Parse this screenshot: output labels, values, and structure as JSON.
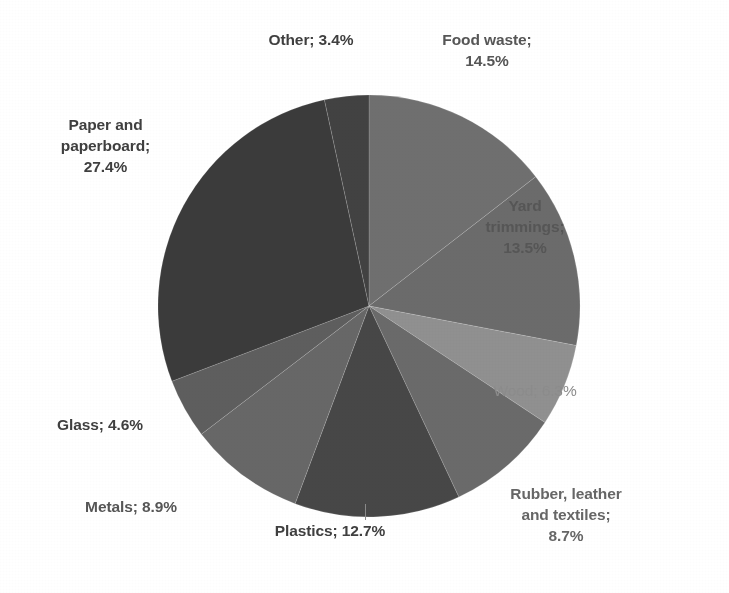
{
  "chart_data": {
    "type": "pie",
    "title": "",
    "subtitle": "",
    "xlabel": "",
    "ylabel": "",
    "legend_position": "none",
    "grid": false,
    "labels_show_name_and_percent": true,
    "label_separator": "; ",
    "start_angle_deg": 0,
    "direction": "clockwise",
    "categories": [
      "Food waste",
      "Yard trimmings",
      "Wood",
      "Rubber, leather and textiles",
      "Plastics",
      "Metals",
      "Glass",
      "Paper and paperboard",
      "Other"
    ],
    "values": [
      14.5,
      13.5,
      6.3,
      8.7,
      12.7,
      8.9,
      4.6,
      27.4,
      3.4
    ],
    "units": "percent",
    "total": 100.0,
    "slices": [
      {
        "name": "Food waste",
        "value": 14.5,
        "percent_text": "14.5%",
        "label_text": "Food waste;\n14.5%",
        "color": "#6f6f6f",
        "start_deg": 0.0,
        "end_deg": 52.2,
        "label_style": "semi"
      },
      {
        "name": "Yard trimmings",
        "value": 13.5,
        "percent_text": "13.5%",
        "label_text": "Yard\ntrimmings;\n13.5%",
        "color": "#6b6b6b",
        "start_deg": 52.2,
        "end_deg": 100.8,
        "label_style": "semi"
      },
      {
        "name": "Wood",
        "value": 6.3,
        "percent_text": "6.3%",
        "label_text": "Wood; 6.3%",
        "color": "#909090",
        "start_deg": 100.8,
        "end_deg": 123.5,
        "label_style": "light"
      },
      {
        "name": "Rubber, leather and textiles",
        "value": 8.7,
        "percent_text": "8.7%",
        "label_text": "Rubber, leather\nand textiles;\n8.7%",
        "color": "#6a6a6a",
        "start_deg": 123.5,
        "end_deg": 154.8,
        "label_style": "mid"
      },
      {
        "name": "Plastics",
        "value": 12.7,
        "percent_text": "12.7%",
        "label_text": "Plastics; 12.7%",
        "color": "#474747",
        "start_deg": 154.8,
        "end_deg": 200.5,
        "label_style": "bold"
      },
      {
        "name": "Metals",
        "value": 8.9,
        "percent_text": "8.9%",
        "label_text": "Metals; 8.9%",
        "color": "#676767",
        "start_deg": 200.5,
        "end_deg": 232.6,
        "label_style": "semi"
      },
      {
        "name": "Glass",
        "value": 4.6,
        "percent_text": "4.6%",
        "label_text": "Glass; 4.6%",
        "color": "#5e5e5e",
        "start_deg": 232.6,
        "end_deg": 249.1,
        "label_style": "bold"
      },
      {
        "name": "Paper and paperboard",
        "value": 27.4,
        "percent_text": "27.4%",
        "label_text": "Paper and\npaperboard;\n27.4%",
        "color": "#3b3b3b",
        "start_deg": 249.1,
        "end_deg": 347.8,
        "label_style": "bold"
      },
      {
        "name": "Other",
        "value": 3.4,
        "percent_text": "3.4%",
        "label_text": "Other; 3.4%",
        "color": "#424242",
        "start_deg": 347.8,
        "end_deg": 360.0,
        "label_style": "bold"
      }
    ],
    "geometry": {
      "center_x": 369,
      "center_y": 306,
      "radius": 211
    },
    "background_color": "#ffffff"
  }
}
